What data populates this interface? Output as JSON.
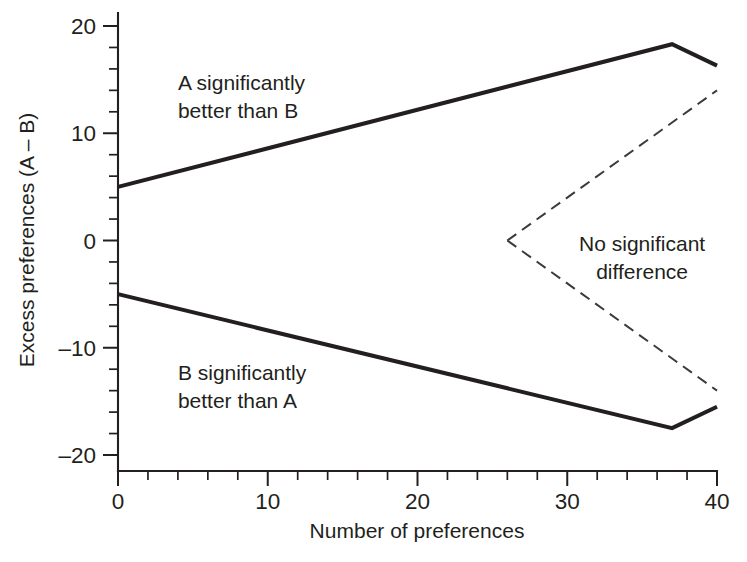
{
  "chart_data": {
    "type": "line",
    "title": "",
    "xlabel": "Number of preferences",
    "ylabel": "Excess preferences (A – B)",
    "xlim": [
      0,
      40
    ],
    "ylim": [
      -20,
      20
    ],
    "grid": false,
    "legend_position": "none",
    "x_ticks_major": [
      0,
      10,
      20,
      30,
      40
    ],
    "x_tick_labels": [
      "0",
      "10",
      "20",
      "30",
      "40"
    ],
    "x_tick_minor_step": 2,
    "y_ticks_major": [
      20,
      10,
      0,
      -10,
      -20
    ],
    "y_tick_labels": [
      "20",
      "10",
      "0",
      "–10",
      "–20"
    ],
    "y_tick_minor_step": 2,
    "series": [
      {
        "name": "Upper significance boundary (A better than B)",
        "style": "solid",
        "color": "#231f20",
        "x": [
          0,
          37,
          40
        ],
        "y": [
          5,
          18.3,
          16.3
        ]
      },
      {
        "name": "Lower significance boundary (B better than A)",
        "style": "solid",
        "color": "#231f20",
        "x": [
          0,
          37,
          40
        ],
        "y": [
          -5,
          -17.5,
          -15.5
        ]
      },
      {
        "name": "No significant difference upper bound",
        "style": "dashed",
        "color": "#3c3a3b",
        "x": [
          26,
          40
        ],
        "y": [
          0,
          14
        ]
      },
      {
        "name": "No significant difference lower bound",
        "style": "dashed",
        "color": "#3c3a3b",
        "x": [
          26,
          40
        ],
        "y": [
          0,
          -14
        ]
      }
    ],
    "annotations": [
      {
        "id": "region-a-better",
        "lines": [
          "A significantly",
          "better than B"
        ],
        "x": 4.0,
        "y": 14.0,
        "align": "left"
      },
      {
        "id": "region-b-better",
        "lines": [
          "B significantly",
          "better than A"
        ],
        "x": 4.0,
        "y": -13.0,
        "align": "left"
      },
      {
        "id": "region-no-difference",
        "lines": [
          "No significant",
          "difference"
        ],
        "x": 35.0,
        "y": -1.0,
        "align": "center"
      }
    ]
  },
  "figure": {
    "background_color": "#ffffff",
    "ink_color": "#231f20",
    "dashed_color": "#3c3a3b"
  }
}
